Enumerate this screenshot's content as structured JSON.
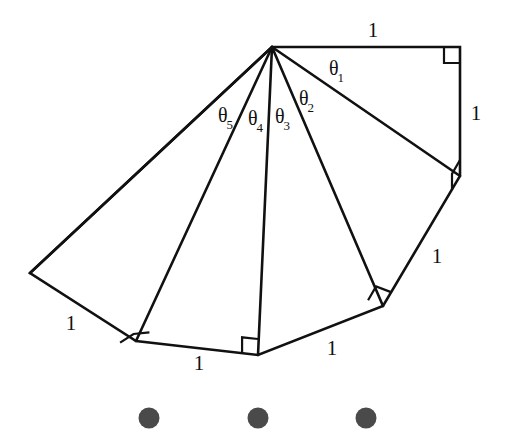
{
  "figure": {
    "stroke_color": "#111111",
    "fill_color": "#ffffff",
    "background_color": "#ffffff",
    "stroke_width": 2.6,
    "apex": {
      "x": 272,
      "y": 47
    },
    "vertices": [
      {
        "name": "apex",
        "x": 272,
        "y": 47
      },
      {
        "name": "v1-top-right",
        "x": 460,
        "y": 47
      },
      {
        "name": "v2-right",
        "x": 460,
        "y": 176
      },
      {
        "name": "v3-lower-right",
        "x": 383,
        "y": 306
      },
      {
        "name": "v4-bottom-center",
        "x": 258,
        "y": 355
      },
      {
        "name": "v5-bottom-left",
        "x": 136,
        "y": 341
      },
      {
        "name": "v6-far-left",
        "x": 30,
        "y": 273
      }
    ],
    "outline_path": "M 272 47 L 460 47 L 460 176 L 383 306 L 258 355 L 136 341 L 30 273 Z",
    "spokes": [
      {
        "name": "spoke-to-v2",
        "from": "apex",
        "to": "v2-right"
      },
      {
        "name": "spoke-to-v3",
        "from": "apex",
        "to": "v3-lower-right"
      },
      {
        "name": "spoke-to-v4",
        "from": "apex",
        "to": "v4-bottom-center"
      },
      {
        "name": "spoke-to-v5",
        "from": "apex",
        "to": "v5-bottom-left"
      },
      {
        "name": "spoke-to-v6",
        "from": "apex",
        "to": "v6-far-left"
      }
    ],
    "right_angle_markers": [
      {
        "name": "right-angle-1",
        "x": 460,
        "y": 47,
        "dir_a": 180,
        "dir_b": 90,
        "size": 16
      },
      {
        "name": "right-angle-2",
        "x": 460,
        "y": 176,
        "dir_a": 270,
        "dir_b": 120,
        "size": 16
      },
      {
        "name": "right-angle-3",
        "x": 383,
        "y": 306,
        "dir_a": 300,
        "dir_b": 201,
        "size": 16
      },
      {
        "name": "right-angle-4",
        "x": 258,
        "y": 355,
        "dir_a": 270,
        "dir_b": 186,
        "size": 16
      },
      {
        "name": "right-angle-5",
        "x": 136,
        "y": 341,
        "dir_a": 174,
        "dir_b": 327,
        "size": 16
      },
      {
        "name": "right-angle-6",
        "x": 30,
        "y": 273,
        "dir_a": 0,
        "dir_b": 0,
        "size": 0
      }
    ]
  },
  "length_labels": [
    {
      "name": "length-label-top",
      "text": "1",
      "x": 373,
      "y": 30
    },
    {
      "name": "length-label-right",
      "text": "1",
      "x": 476,
      "y": 113
    },
    {
      "name": "length-label-lower-right",
      "text": "1",
      "x": 437,
      "y": 256
    },
    {
      "name": "length-label-bottom-right",
      "text": "1",
      "x": 332,
      "y": 348
    },
    {
      "name": "length-label-bottom-left",
      "text": "1",
      "x": 199,
      "y": 363
    },
    {
      "name": "length-label-left",
      "text": "1",
      "x": 71,
      "y": 323
    }
  ],
  "angle_labels": [
    {
      "name": "angle-label-theta-1",
      "symbol": "θ",
      "subscript": "1",
      "x": 337,
      "y": 70
    },
    {
      "name": "angle-label-theta-2",
      "symbol": "θ",
      "subscript": "2",
      "x": 307,
      "y": 100
    },
    {
      "name": "angle-label-theta-3",
      "symbol": "θ",
      "subscript": "3",
      "x": 283,
      "y": 118
    },
    {
      "name": "angle-label-theta-4",
      "symbol": "θ",
      "subscript": "4",
      "x": 256,
      "y": 120
    },
    {
      "name": "angle-label-theta-5",
      "symbol": "θ",
      "subscript": "5",
      "x": 226,
      "y": 117
    }
  ],
  "ellipsis": {
    "name": "continuation-ellipsis",
    "color": "#4a4a4a",
    "diameter": 21,
    "dots": [
      {
        "name": "ellipsis-dot-1",
        "x": 149,
        "y": 418
      },
      {
        "name": "ellipsis-dot-2",
        "x": 258,
        "y": 418
      },
      {
        "name": "ellipsis-dot-3",
        "x": 366,
        "y": 418
      }
    ]
  }
}
